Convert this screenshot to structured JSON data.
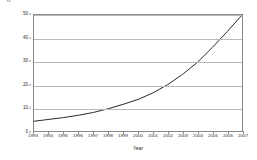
{
  "chart_data": {
    "type": "line",
    "title": "",
    "xlabel": "Year",
    "ylabel": "Prevalence (per 10 000)",
    "xlim": [
      1993,
      2007
    ],
    "ylim": [
      0,
      50
    ],
    "grid": true,
    "legend": null,
    "x": [
      1993,
      1994,
      1995,
      1996,
      1997,
      1998,
      1999,
      2000,
      2001,
      2002,
      2003,
      2004,
      2005,
      2006,
      2007
    ],
    "series": [
      {
        "name": "Prevalence",
        "color": "#2b2b2b",
        "marker": "none",
        "values": [
          4.2,
          5.0,
          5.8,
          6.8,
          8.0,
          9.6,
          11.5,
          13.6,
          16.4,
          20.0,
          24.4,
          29.6,
          36.0,
          42.8,
          50.0
        ]
      }
    ],
    "x_tick_labels": [
      "1993",
      "1994",
      "1995",
      "1996",
      "1997",
      "1998",
      "1999",
      "2000",
      "2001",
      "2002",
      "2003",
      "2004",
      "2005",
      "2006",
      "2007"
    ],
    "y_tick_labels": [
      "0",
      "10",
      "20",
      "30",
      "40",
      "50"
    ],
    "y_ticks": [
      0,
      10,
      20,
      30,
      40,
      50
    ],
    "colors": {
      "line": "#2b2b2b",
      "gridline": "#b9b9b9",
      "frame": "#8a8a8a",
      "background": "#ffffff",
      "text": "#1c1c1c"
    }
  }
}
